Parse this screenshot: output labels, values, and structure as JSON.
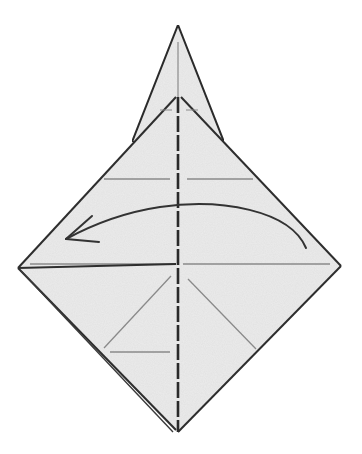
{
  "diagram": {
    "type": "origami-step",
    "description": "Origami folding step: diamond-shaped paper with a narrow kite tip on top; dashed valley-fold line down the center; curved arrow indicating folding the right flap over to the left.",
    "colors": {
      "background": "#ffffff",
      "paper": "#ececec",
      "edge": "#2e2e2e",
      "crease": "#8a8a8a",
      "arrow": "#333333"
    },
    "elements": {
      "kite_tip": "top-point",
      "inner_flap": "upper-flap",
      "diamond_base": "lower-body",
      "center_fold": "valley-fold-dashed",
      "arrow": "fold-left-arrow"
    }
  }
}
